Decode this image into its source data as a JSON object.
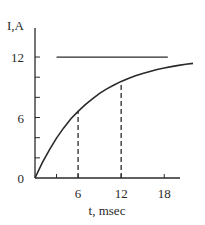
{
  "chart_data": {
    "type": "line",
    "title": "",
    "xlabel": "t, msec",
    "ylabel": "I,A",
    "xlim": [
      0,
      22
    ],
    "ylim": [
      0,
      12
    ],
    "x_ticks": [
      {
        "value": 3,
        "label": ""
      },
      {
        "value": 6,
        "label": "6"
      },
      {
        "value": 12,
        "label": "12"
      },
      {
        "value": 18,
        "label": "18"
      }
    ],
    "y_ticks": [
      {
        "value": 0,
        "label": "0"
      },
      {
        "value": 2,
        "label": ""
      },
      {
        "value": 4,
        "label": ""
      },
      {
        "value": 6,
        "label": "6"
      },
      {
        "value": 8,
        "label": ""
      },
      {
        "value": 10,
        "label": ""
      },
      {
        "value": 12,
        "label": "12"
      }
    ],
    "grid": false,
    "legend": null,
    "series": [
      {
        "name": "I(t) = 12(1 - e^(-t/7.5))",
        "style": "solid",
        "x": [
          0,
          1,
          2,
          3,
          4,
          5,
          6,
          7,
          8,
          9,
          10,
          11,
          12,
          13,
          14,
          15,
          16,
          17,
          18,
          19,
          20,
          21,
          22
        ],
        "values": [
          0,
          1.5,
          2.8,
          3.96,
          4.97,
          5.87,
          6.61,
          7.28,
          7.86,
          8.39,
          8.84,
          9.23,
          9.58,
          9.88,
          10.14,
          10.38,
          10.58,
          10.76,
          10.91,
          11.05,
          11.17,
          11.28,
          11.37
        ]
      }
    ],
    "annotations": [
      {
        "type": "hline",
        "y": 12,
        "x_start": 3,
        "x_end": 18.5,
        "style": "solid",
        "label": "asymptote"
      },
      {
        "type": "vline",
        "x": 6,
        "y_start": 0,
        "y_end": 6.6,
        "style": "dashed"
      },
      {
        "type": "vline",
        "x": 12,
        "y_start": 0,
        "y_end": 9.6,
        "style": "dashed"
      }
    ],
    "geometry": {
      "origin_px": [
        35,
        178
      ],
      "x_px_per_unit": 7.18,
      "y_px_per_unit": 10.08,
      "y_axis_top_px": 28,
      "x_axis_end_px": 180
    },
    "colors": {
      "line": "#2a2a2a",
      "text": "#2a2a2a",
      "background": "#ffffff"
    }
  }
}
